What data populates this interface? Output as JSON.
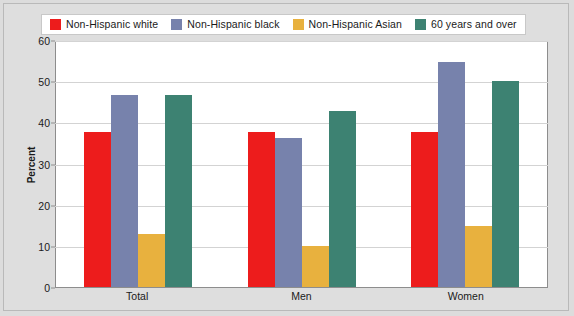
{
  "chart_data": {
    "type": "bar",
    "title": "",
    "subtitle": "",
    "xlabel": "",
    "ylabel": "Percent",
    "ylim": [
      0,
      60
    ],
    "yticks": [
      0,
      10,
      20,
      30,
      40,
      50,
      60
    ],
    "ytick_labels": [
      "0",
      "10",
      "20",
      "30",
      "40",
      "50",
      "60"
    ],
    "grid": true,
    "legend_position": "top",
    "categories": [
      "Total",
      "Men",
      "Women"
    ],
    "series": [
      {
        "name": "Non-Hispanic white",
        "color": "#ED1C1C",
        "values": [
          38,
          38,
          38
        ]
      },
      {
        "name": "Non-Hispanic black",
        "color": "#7782AC",
        "values": [
          47,
          36.5,
          55
        ]
      },
      {
        "name": "Non-Hispanic Asian",
        "color": "#E8B13E",
        "values": [
          13,
          10,
          15
        ]
      },
      {
        "name": "60 years and over",
        "color": "#3D8272",
        "values": [
          47,
          43,
          50.5
        ]
      }
    ]
  },
  "legend": {
    "items": [
      {
        "label": "Non-Hispanic white",
        "color": "#ED1C1C",
        "swatch": "legend-swatch-red"
      },
      {
        "label": "Non-Hispanic black",
        "color": "#7782AC",
        "swatch": "legend-swatch-blue"
      },
      {
        "label": "Non-Hispanic Asian",
        "color": "#E8B13E",
        "swatch": "legend-swatch-gold"
      },
      {
        "label": "60 years and over",
        "color": "#3D8272",
        "swatch": "legend-swatch-green"
      }
    ]
  },
  "axes": {
    "y_title": "Percent",
    "y_tick_labels": [
      "60",
      "50",
      "40",
      "30",
      "20",
      "10",
      "0"
    ],
    "x_tick_labels": [
      "Total",
      "Men",
      "Women"
    ]
  },
  "colors": {
    "page_background": "#dedede",
    "plot_background": "#ffffff",
    "plot_border": "#8d8d8d",
    "gridline": "#d3d3d3",
    "text": "#1a1a1a"
  }
}
